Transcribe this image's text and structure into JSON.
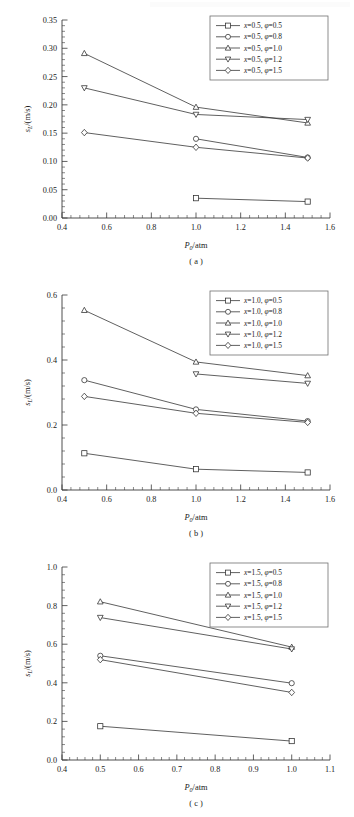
{
  "figure": {
    "axis_label_y": "s_L/(m/s)",
    "axis_label_x": "P_0/atm",
    "x_symbol": "P",
    "x_sub": "0",
    "x_unit": "/atm",
    "y_symbol": "s",
    "y_sub": "L",
    "y_unit": "/(m/s)",
    "line_color": "#2b2b2b",
    "marker_fill": "#ffffff",
    "frame_color": "#3a3a3a"
  },
  "panels": [
    {
      "id": "a",
      "caption": "( a )",
      "chart_data": {
        "type": "line",
        "title": "",
        "xlabel": "P0/atm",
        "ylabel": "sL/(m/s)",
        "xlim": [
          0.4,
          1.6
        ],
        "ylim": [
          0.0,
          0.35
        ],
        "xticks": [
          0.4,
          0.6,
          0.8,
          1.0,
          1.2,
          1.4,
          1.6
        ],
        "xticklabels": [
          "0.4",
          "0.6",
          "0.8",
          "1.0",
          "1.2",
          "1.4",
          "1.6"
        ],
        "yticks": [
          0.0,
          0.05,
          0.1,
          0.15,
          0.2,
          0.25,
          0.3,
          0.35
        ],
        "yticklabels": [
          "0.00",
          "0.05",
          "0.10",
          "0.15",
          "0.20",
          "0.25",
          "0.30",
          "0.35"
        ],
        "grid": false,
        "legend_position": "top-right",
        "series": [
          {
            "name": "x=0.5, φ=0.5",
            "marker": "square",
            "x": [
              1.0,
              1.5
            ],
            "values": [
              0.035,
              0.029
            ]
          },
          {
            "name": "x=0.5, φ=0.8",
            "marker": "circle",
            "x": [
              1.0,
              1.5
            ],
            "values": [
              0.14,
              0.107
            ]
          },
          {
            "name": "x=0.5, φ=1.0",
            "marker": "triangle-up",
            "x": [
              0.5,
              1.0,
              1.5
            ],
            "values": [
              0.291,
              0.196,
              0.168
            ]
          },
          {
            "name": "x=0.5, φ=1.2",
            "marker": "triangle-down",
            "x": [
              0.5,
              1.0,
              1.5
            ],
            "values": [
              0.23,
              0.183,
              0.174
            ]
          },
          {
            "name": "x=0.5, φ=1.5",
            "marker": "diamond",
            "x": [
              0.5,
              1.0,
              1.5
            ],
            "values": [
              0.151,
              0.125,
              0.106
            ]
          }
        ]
      },
      "legend": [
        {
          "label_x": "x=0.5",
          "label_phi": "φ=0.5",
          "marker": "square"
        },
        {
          "label_x": "x=0.5",
          "label_phi": "φ=0.8",
          "marker": "circle"
        },
        {
          "label_x": "x=0.5",
          "label_phi": "φ=1.0",
          "marker": "triangle-up"
        },
        {
          "label_x": "x=0.5",
          "label_phi": "φ=1.2",
          "marker": "triangle-down"
        },
        {
          "label_x": "x=0.5",
          "label_phi": "φ=1.5",
          "marker": "diamond"
        }
      ]
    },
    {
      "id": "b",
      "caption": "( b )",
      "chart_data": {
        "type": "line",
        "title": "",
        "xlabel": "P0/atm",
        "ylabel": "sL/(m/s)",
        "xlim": [
          0.4,
          1.6
        ],
        "ylim": [
          0.0,
          0.6
        ],
        "xticks": [
          0.4,
          0.6,
          0.8,
          1.0,
          1.2,
          1.4,
          1.6
        ],
        "xticklabels": [
          "0.4",
          "0.6",
          "0.8",
          "1.0",
          "1.2",
          "1.4",
          "1.6"
        ],
        "yticks": [
          0.0,
          0.2,
          0.4,
          0.6
        ],
        "yticklabels": [
          "0.0",
          "0.2",
          "0.4",
          "0.6"
        ],
        "grid": false,
        "legend_position": "top-right",
        "series": [
          {
            "name": "x=1.0, φ=0.5",
            "marker": "square",
            "x": [
              0.5,
              1.0,
              1.5
            ],
            "values": [
              0.113,
              0.064,
              0.054
            ]
          },
          {
            "name": "x=1.0, φ=0.8",
            "marker": "circle",
            "x": [
              0.5,
              1.0,
              1.5
            ],
            "values": [
              0.338,
              0.248,
              0.212
            ]
          },
          {
            "name": "x=1.0, φ=1.0",
            "marker": "triangle-up",
            "x": [
              0.5,
              1.0,
              1.5
            ],
            "values": [
              0.553,
              0.394,
              0.352
            ]
          },
          {
            "name": "x=1.0, φ=1.2",
            "marker": "triangle-down",
            "x": [
              1.0,
              1.5
            ],
            "values": [
              0.357,
              0.328
            ]
          },
          {
            "name": "x=1.0, φ=1.5",
            "marker": "diamond",
            "x": [
              0.5,
              1.0,
              1.5
            ],
            "values": [
              0.288,
              0.236,
              0.208
            ]
          }
        ]
      },
      "legend": [
        {
          "label_x": "x=1.0",
          "label_phi": "φ=0.5",
          "marker": "square"
        },
        {
          "label_x": "x=1.0",
          "label_phi": "φ=0.8",
          "marker": "circle"
        },
        {
          "label_x": "x=1.0",
          "label_phi": "φ=1.0",
          "marker": "triangle-up"
        },
        {
          "label_x": "x=1.0",
          "label_phi": "φ=1.2",
          "marker": "triangle-down"
        },
        {
          "label_x": "x=1.0",
          "label_phi": "φ=1.5",
          "marker": "diamond"
        }
      ]
    },
    {
      "id": "c",
      "caption": "( c )",
      "chart_data": {
        "type": "line",
        "title": "",
        "xlabel": "P0/atm",
        "ylabel": "sL/(m/s)",
        "xlim": [
          0.4,
          1.1
        ],
        "ylim": [
          0.0,
          1.0
        ],
        "xticks": [
          0.4,
          0.5,
          0.6,
          0.7,
          0.8,
          0.9,
          1.0,
          1.1
        ],
        "xticklabels": [
          "0.4",
          "0.5",
          "0.6",
          "0.7",
          "0.8",
          "0.9",
          "1.0",
          "1.1"
        ],
        "yticks": [
          0.0,
          0.2,
          0.4,
          0.6,
          0.8,
          1.0
        ],
        "yticklabels": [
          "0.0",
          "0.2",
          "0.4",
          "0.6",
          "0.8",
          "1.0"
        ],
        "grid": false,
        "legend_position": "top-right",
        "series": [
          {
            "name": "x=1.5, φ=0.5",
            "marker": "square",
            "x": [
              0.5,
              1.0
            ],
            "values": [
              0.175,
              0.098
            ]
          },
          {
            "name": "x=1.5, φ=0.8",
            "marker": "circle",
            "x": [
              0.5,
              1.0
            ],
            "values": [
              0.54,
              0.398
            ]
          },
          {
            "name": "x=1.5, φ=1.0",
            "marker": "triangle-up",
            "x": [
              0.5,
              1.0
            ],
            "values": [
              0.82,
              0.585
            ]
          },
          {
            "name": "x=1.5, φ=1.2",
            "marker": "triangle-down",
            "x": [
              0.5,
              1.0
            ],
            "values": [
              0.738,
              0.575
            ]
          },
          {
            "name": "x=1.5, φ=1.5",
            "marker": "diamond",
            "x": [
              0.5,
              1.0
            ],
            "values": [
              0.52,
              0.35
            ]
          }
        ]
      },
      "legend": [
        {
          "label_x": "x=1.5",
          "label_phi": "φ=0.5",
          "marker": "square"
        },
        {
          "label_x": "x=1.5",
          "label_phi": "φ=0.8",
          "marker": "circle"
        },
        {
          "label_x": "x=1.5",
          "label_phi": "φ=1.0",
          "marker": "triangle-up"
        },
        {
          "label_x": "x=1.5",
          "label_phi": "φ=1.2",
          "marker": "triangle-down"
        },
        {
          "label_x": "x=1.5",
          "label_phi": "φ=1.5",
          "marker": "diamond"
        }
      ]
    }
  ]
}
